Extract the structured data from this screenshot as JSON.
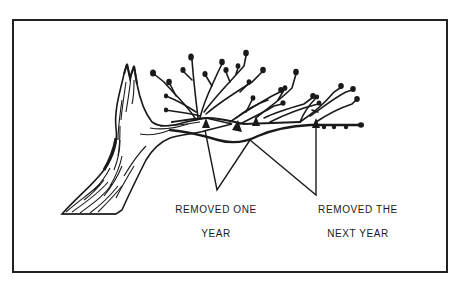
{
  "figure": {
    "frame_color": "#222222",
    "ink_color": "#1a1a1a",
    "labels": [
      {
        "id": "left",
        "lines": [
          "REMOVED ONE",
          "YEAR"
        ]
      },
      {
        "id": "right",
        "lines": [
          "REMOVED THE",
          "NEXT YEAR"
        ]
      }
    ],
    "callouts": [
      {
        "label": "left",
        "points_to": [
          [
            205,
            128
          ],
          [
            250,
            140
          ]
        ],
        "origin": [
          217,
          190
        ]
      },
      {
        "label": "right",
        "points_to": [
          [
            250,
            140
          ],
          [
            316,
            125
          ]
        ],
        "origin": [
          316,
          195
        ]
      }
    ]
  }
}
